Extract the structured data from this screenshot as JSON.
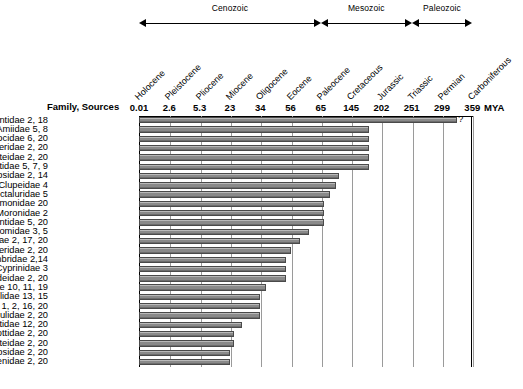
{
  "figure": {
    "axis_unit_label": "MYA",
    "row_header": "Family, Sources",
    "uncertainty_marker": "?",
    "bar_color": "#8a8a8a",
    "bar_border_color": "#4a4a4a",
    "grid_color": "#9a9a9a"
  },
  "eras": [
    {
      "name": "Cenozoic",
      "start_tick": 0,
      "end_tick": 6
    },
    {
      "name": "Mesozoic",
      "start_tick": 6,
      "end_tick": 9
    },
    {
      "name": "Paleozoic",
      "start_tick": 9,
      "end_tick": 11
    }
  ],
  "epochs": [
    "Holocene",
    "Pleistocene",
    "Pliocene",
    "Miocene",
    "Oligocene",
    "Eocene",
    "Paleocene",
    "Cretaceous",
    "Jurassic",
    "Triassic",
    "Permian",
    "Carboniferous"
  ],
  "ticks": [
    "0.01",
    "2.6",
    "5.3",
    "23",
    "34",
    "56",
    "65",
    "145",
    "202",
    "251",
    "299",
    "359"
  ],
  "chart_data": {
    "type": "bar",
    "orientation": "horizontal",
    "title": "",
    "xlabel": "MYA",
    "ylabel": "Family, Sources",
    "axis_type": "categorical-epoch-scale",
    "grid": true,
    "legend": null,
    "x_tick_values_mya": [
      0.01,
      2.6,
      5.3,
      23,
      34,
      56,
      65,
      145,
      202,
      251,
      299,
      359
    ],
    "x_tick_labels": [
      "0.01",
      "2.6",
      "5.3",
      "23",
      "34",
      "56",
      "65",
      "145",
      "202",
      "251",
      "299",
      "359"
    ],
    "x_epoch_labels": [
      "Holocene",
      "Pleistocene",
      "Pliocene",
      "Miocene",
      "Oligocene",
      "Eocene",
      "Paleocene",
      "Cretaceous",
      "Jurassic",
      "Triassic",
      "Permian",
      "Carboniferous"
    ],
    "era_spans": [
      {
        "name": "Cenozoic",
        "from_mya": 0.01,
        "to_mya": 65
      },
      {
        "name": "Mesozoic",
        "from_mya": 65,
        "to_mya": 251
      },
      {
        "name": "Paleozoic",
        "from_mya": 251,
        "to_mya": 359
      }
    ],
    "categories": [
      "Petromyzontidae 2, 18",
      "Amiidae 5, 8",
      "Esocidae 6, 20",
      "Acipenseridae 2, 20",
      "Lepisosteidae 2, 20",
      "Polyodontidae 5, 7, 9",
      "Percopsidae 2, 14",
      "Clupeidae 4",
      "Ictaluridae 5",
      "Salmonidae 20",
      "Moronidae 2",
      "Hiodontidae 5, 20",
      "Catostomidae 3, 5",
      "Centrarchidae 2, 17, 20",
      "Aphredoderidae 2, 20",
      "Umbridae 2,14",
      "Cyprinidae 3",
      "Goodeidae 2, 20",
      "Poeciliidae 10, 11, 19",
      "Cichlidae 13, 15",
      "Percidae 1, 2, 16, 20",
      "Fundulidae 2, 20",
      "Cyprinodontidae 12, 20",
      "Cottidae 2, 20",
      "Gasterosteidae 2, 20",
      "Atherinopsidae 2, 20",
      "Sciaenidae 2, 20"
    ],
    "values": [
      10.5,
      7.6,
      7.6,
      7.6,
      7.6,
      7.6,
      6.6,
      6.5,
      6.3,
      6.1,
      6.1,
      6.1,
      5.6,
      5.3,
      5.0,
      4.85,
      4.85,
      4.85,
      4.2,
      4.0,
      4.0,
      4.0,
      3.4,
      3.15,
      3.15,
      3.0,
      3.0
    ],
    "values_unit": "tick-column index (categorical epoch axis)",
    "bar_end_mya": [
      320,
      145,
      145,
      145,
      145,
      145,
      80,
      75,
      68,
      62,
      62,
      62,
      48,
      40,
      36,
      34,
      34,
      34,
      28,
      26,
      26,
      26,
      23,
      21,
      21,
      20,
      20
    ],
    "annotations": [
      {
        "category": "Petromyzontidae 2, 18",
        "text": "?",
        "meaning": "uncertain earliest occurrence"
      }
    ]
  },
  "rows": [
    {
      "label": "Petromyzontidae 2, 18",
      "extent": 10.5,
      "uncertain": true
    },
    {
      "label": "Amiidae 5, 8",
      "extent": 7.6,
      "uncertain": false
    },
    {
      "label": "Esocidae 6, 20",
      "extent": 7.6,
      "uncertain": false
    },
    {
      "label": "Acipenseridae 2, 20",
      "extent": 7.6,
      "uncertain": false
    },
    {
      "label": "Lepisosteidae 2, 20",
      "extent": 7.6,
      "uncertain": false
    },
    {
      "label": "Polyodontidae 5, 7, 9",
      "extent": 7.6,
      "uncertain": false
    },
    {
      "label": "Percopsidae 2, 14",
      "extent": 6.6,
      "uncertain": false
    },
    {
      "label": "Clupeidae 4",
      "extent": 6.5,
      "uncertain": false
    },
    {
      "label": "Ictaluridae 5",
      "extent": 6.3,
      "uncertain": false
    },
    {
      "label": "Salmonidae 20",
      "extent": 6.1,
      "uncertain": false
    },
    {
      "label": "Moronidae 2",
      "extent": 6.1,
      "uncertain": false
    },
    {
      "label": "Hiodontidae 5, 20",
      "extent": 6.1,
      "uncertain": false
    },
    {
      "label": "Catostomidae 3, 5",
      "extent": 5.6,
      "uncertain": false
    },
    {
      "label": "Centrarchidae 2, 17, 20",
      "extent": 5.3,
      "uncertain": false
    },
    {
      "label": "Aphredoderidae 2, 20",
      "extent": 5.0,
      "uncertain": false
    },
    {
      "label": "Umbridae 2,14",
      "extent": 4.85,
      "uncertain": false
    },
    {
      "label": "Cyprinidae 3",
      "extent": 4.85,
      "uncertain": false
    },
    {
      "label": "Goodeidae 2, 20",
      "extent": 4.85,
      "uncertain": false
    },
    {
      "label": "Poeciliidae 10, 11, 19",
      "extent": 4.2,
      "uncertain": false
    },
    {
      "label": "Cichlidae 13, 15",
      "extent": 4.0,
      "uncertain": false
    },
    {
      "label": "Percidae 1, 2, 16, 20",
      "extent": 4.0,
      "uncertain": false
    },
    {
      "label": "Fundulidae 2, 20",
      "extent": 4.0,
      "uncertain": false
    },
    {
      "label": "Cyprinodontidae 12, 20",
      "extent": 3.4,
      "uncertain": false
    },
    {
      "label": "Cottidae 2, 20",
      "extent": 3.15,
      "uncertain": false
    },
    {
      "label": "Gasterosteidae 2, 20",
      "extent": 3.15,
      "uncertain": false
    },
    {
      "label": "Atherinopsidae 2, 20",
      "extent": 3.0,
      "uncertain": false
    },
    {
      "label": "Sciaenidae 2, 20",
      "extent": 3.0,
      "uncertain": false
    }
  ]
}
